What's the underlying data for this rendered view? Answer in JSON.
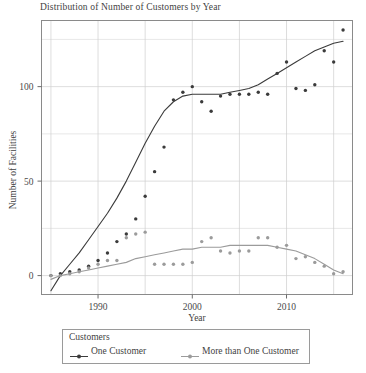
{
  "chart_data": {
    "type": "scatter",
    "title": "Distribution of Number of Customers by Year",
    "xlabel": "Year",
    "ylabel": "Number of Facilities",
    "xlim": [
      1984,
      2017
    ],
    "ylim": [
      -10,
      135
    ],
    "xticks": [
      1990,
      2000,
      2010
    ],
    "yticks": [
      0,
      50,
      100
    ],
    "grid": true,
    "legend_title": "Customers",
    "legend_position": "bottom",
    "series": [
      {
        "name": "One Customer",
        "color": "#3b3b3b",
        "marker": "filled-circle",
        "smoother": "lowess",
        "x": [
          1985,
          1986,
          1987,
          1988,
          1989,
          1990,
          1991,
          1992,
          1993,
          1994,
          1995,
          1996,
          1997,
          1998,
          1999,
          2000,
          2001,
          2002,
          2003,
          2004,
          2005,
          2006,
          2007,
          2008,
          2009,
          2010,
          2011,
          2012,
          2013,
          2014,
          2015,
          2016
        ],
        "y": [
          0,
          1,
          2,
          3,
          5,
          8,
          12,
          18,
          22,
          30,
          42,
          55,
          68,
          93,
          97,
          100,
          92,
          87,
          95,
          96,
          96,
          96,
          97,
          96,
          107,
          113,
          99,
          98,
          101,
          119,
          113,
          130
        ],
        "smooth_y": [
          -8,
          0,
          6,
          12,
          19,
          26,
          33,
          41,
          50,
          60,
          70,
          79,
          87,
          92,
          95,
          96,
          96,
          96,
          96,
          97,
          98,
          99,
          101,
          104,
          107,
          110,
          113,
          116,
          119,
          121,
          123,
          124
        ]
      },
      {
        "name": "More than One Customer",
        "color": "#9b9b9b",
        "marker": "filled-circle",
        "smoother": "lowess",
        "x": [
          1985,
          1986,
          1987,
          1988,
          1989,
          1990,
          1991,
          1992,
          1993,
          1994,
          1995,
          1996,
          1997,
          1998,
          1999,
          2000,
          2001,
          2002,
          2003,
          2004,
          2005,
          2006,
          2007,
          2008,
          2009,
          2010,
          2011,
          2012,
          2013,
          2014,
          2015,
          2016
        ],
        "y": [
          0,
          0,
          1,
          2,
          4,
          6,
          8,
          8,
          20,
          22,
          23,
          6,
          6,
          6,
          6,
          7,
          18,
          20,
          13,
          12,
          13,
          13,
          20,
          20,
          15,
          16,
          9,
          10,
          7,
          5,
          1,
          2
        ],
        "smooth_y": [
          -2,
          0,
          1,
          2,
          3,
          4,
          5,
          6,
          7,
          9,
          10,
          11,
          12,
          13,
          14,
          14,
          15,
          15,
          15,
          16,
          16,
          16,
          16,
          16,
          15,
          14,
          13,
          11,
          9,
          6,
          3,
          1
        ]
      }
    ]
  },
  "legend": {
    "title": "Customers",
    "entries": [
      {
        "label": "One Customer",
        "color": "#3b3b3b"
      },
      {
        "label": "More than One Customer",
        "color": "#9b9b9b"
      }
    ]
  },
  "axes": {
    "x_title": "Year",
    "y_title": "Number of Facilities",
    "x_tick_labels": [
      "1990",
      "2000",
      "2010"
    ],
    "y_tick_labels": [
      "0",
      "50",
      "100"
    ]
  },
  "colors": {
    "one_customer": "#3b3b3b",
    "more_than_one": "#9b9b9b",
    "grid": "#cfcfcf",
    "frame": "#8a8a8a",
    "text": "#3f3f3f"
  }
}
